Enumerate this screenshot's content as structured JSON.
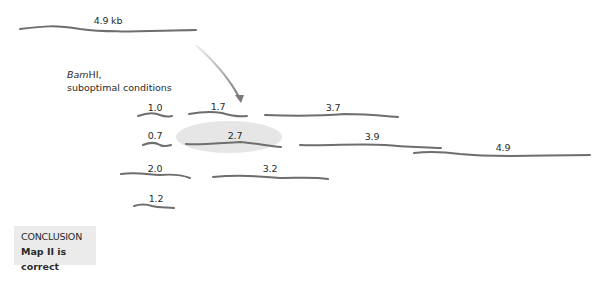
{
  "uncut": {
    "label": "4.9 kb"
  },
  "enzyme": {
    "name_italic": "Bam",
    "name_rest": "HI,",
    "condition": "suboptimal conditions"
  },
  "fragments": [
    {
      "label": "1.0",
      "row": 1
    },
    {
      "label": "1.7",
      "row": 1
    },
    {
      "label": "3.7",
      "row": 1
    },
    {
      "label": "0.7",
      "row": 2
    },
    {
      "label": "2.7",
      "row": 2,
      "highlighted": true
    },
    {
      "label": "3.9",
      "row": 2
    },
    {
      "label": "4.9",
      "row": 2
    },
    {
      "label": "2.0",
      "row": 3
    },
    {
      "label": "3.2",
      "row": 3
    },
    {
      "label": "1.2",
      "row": 4
    }
  ],
  "conclusion": {
    "title": "CONCLUSION",
    "text": "Map II is correct"
  },
  "colors": {
    "dna": "#6e6e6e",
    "highlight": "#e6e6e6",
    "box": "#ebebeb",
    "arrow_start": "#e0e0e0",
    "arrow_end": "#7a7a7a"
  }
}
